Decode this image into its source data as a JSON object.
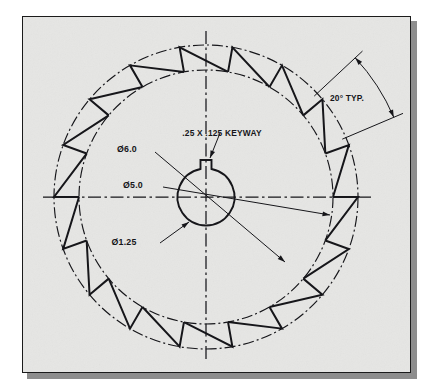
{
  "drawing": {
    "title": "Ratchet Wheel Detail View",
    "sheet": {
      "background_color": "#e6e6e4",
      "border_color": "#1b1b1b",
      "shadow_color": "#8d8d8d",
      "page_color": "#ffffff"
    },
    "line_color": "#16161a",
    "geometry": {
      "center_x": 206,
      "center_y": 197,
      "outer_circle_radius": 152,
      "inner_circle_radius": 127,
      "hub_circle_radius": 28.5,
      "tooth_count": 18,
      "tooth_pitch_degrees": 20,
      "keyway_width": 11,
      "keyway_depth": 9,
      "centerline_h_start_x": 43,
      "centerline_h_end_x": 371,
      "centerline_v_start_y": 31,
      "centerline_v_end_y": 362
    },
    "dimensions": [
      {
        "id": "outer-dia",
        "label": "Ø6.0",
        "text_x": 127,
        "text_y": 152,
        "leader_x1": 155,
        "leader_y1": 152,
        "leader_x2": 285,
        "leader_y2": 262,
        "kind": "diameter"
      },
      {
        "id": "pitch-dia",
        "label": "Ø5.0",
        "text_x": 133,
        "text_y": 188,
        "leader_x1": 163,
        "leader_y1": 187,
        "leader_x2": 330,
        "leader_y2": 215,
        "kind": "diameter"
      },
      {
        "id": "bore-dia",
        "label": "Ø1.25",
        "text_x": 124,
        "text_y": 245,
        "leader_x1": 160,
        "leader_y1": 243,
        "leader_x2": 189,
        "leader_y2": 222,
        "kind": "diameter"
      },
      {
        "id": "keyway-note",
        "label": ".25 X .125 KEYWAY",
        "text_x": 222,
        "text_y": 136,
        "leader_x1": 220,
        "leader_y1": 133,
        "leader_x2": 210,
        "leader_y2": 158,
        "kind": "note"
      },
      {
        "id": "angle-typ",
        "label": "20° TYP.",
        "text_x": 347,
        "text_y": 101,
        "kind": "angular",
        "value": 20,
        "unit": "degrees",
        "modifier": "TYP."
      }
    ],
    "centerlines": {
      "style": "dash-dot",
      "horizontal_visible": true,
      "vertical_visible": true
    },
    "circles": [
      {
        "id": "outer-dash-dot",
        "style": "dash-dot",
        "radius": 152,
        "label": "Ø6.0"
      },
      {
        "id": "inner-dashed",
        "style": "dash-dot",
        "radius": 127,
        "label": "Ø5.0"
      },
      {
        "id": "hub-solid",
        "style": "solid",
        "radius": 28.5,
        "label": "Ø1.25"
      }
    ]
  }
}
